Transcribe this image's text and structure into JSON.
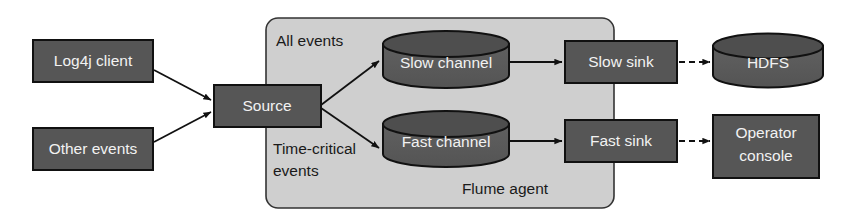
{
  "diagram": {
    "colors": {
      "box_fill": "#565656",
      "box_stroke": "#111111",
      "box_text": "#f2f2f2",
      "cylinder_fill": "#5a5a5a",
      "cylinder_top_fill": "#4a4a4a",
      "container_fill": "#cfcfcf",
      "container_stroke": "#333333",
      "arrow_color": "#111111",
      "caption_text": "#1a1a1a",
      "background": "#ffffff"
    },
    "sources": [
      {
        "id": "log4j-client",
        "label": "Log4j client",
        "shape": "rect"
      },
      {
        "id": "other-events",
        "label": "Other events",
        "shape": "rect"
      }
    ],
    "agent": {
      "label": "Flume agent",
      "captions": [
        {
          "id": "all-events",
          "label": "All events"
        },
        {
          "id": "time-critical-events",
          "line1": "Time-critical",
          "line2": "events"
        }
      ],
      "source_node": {
        "id": "source",
        "label": "Source",
        "shape": "rect"
      },
      "channels": [
        {
          "id": "slow-channel",
          "label": "Slow channel",
          "shape": "cylinder"
        },
        {
          "id": "fast-channel",
          "label": "Fast channel",
          "shape": "cylinder"
        }
      ],
      "sinks": [
        {
          "id": "slow-sink",
          "label": "Slow sink",
          "shape": "rect"
        },
        {
          "id": "fast-sink",
          "label": "Fast sink",
          "shape": "rect"
        }
      ]
    },
    "destinations": [
      {
        "id": "hdfs",
        "label": "HDFS",
        "shape": "cylinder"
      },
      {
        "id": "operator-console",
        "line1": "Operator",
        "line2": "console",
        "shape": "rect"
      }
    ],
    "edges": [
      {
        "id": "log4j-to-source",
        "from": "Log4j client",
        "to": "Source",
        "style": "solid"
      },
      {
        "id": "other-to-source",
        "from": "Other events",
        "to": "Source",
        "style": "solid"
      },
      {
        "id": "source-to-slow-channel",
        "from": "Source",
        "to": "Slow channel",
        "style": "solid"
      },
      {
        "id": "source-to-fast-channel",
        "from": "Source",
        "to": "Fast channel",
        "style": "solid"
      },
      {
        "id": "slow-channel-to-slow-sink",
        "from": "Slow channel",
        "to": "Slow sink",
        "style": "solid"
      },
      {
        "id": "fast-channel-to-fast-sink",
        "from": "Fast channel",
        "to": "Fast sink",
        "style": "solid"
      },
      {
        "id": "slow-sink-to-hdfs",
        "from": "Slow sink",
        "to": "HDFS",
        "style": "dashed"
      },
      {
        "id": "fast-sink-to-operator-console",
        "from": "Fast sink",
        "to": "Operator console",
        "style": "dashed"
      }
    ]
  }
}
